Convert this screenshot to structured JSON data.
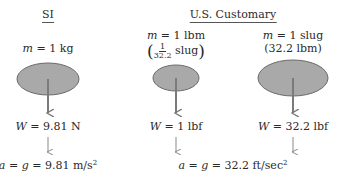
{
  "columns": [
    {
      "id": "si",
      "header": "SI",
      "mass_var": "m",
      "mass_text": "= 1 kg",
      "weight_var": "W",
      "weight_text": "= 9.81 N"
    },
    {
      "id": "us-lbm",
      "header": "",
      "mass_var": "m",
      "mass_text": "= 1 lbm",
      "mass_equiv_numerator": "1",
      "mass_equiv_denominator": "32.2",
      "mass_equiv_unit": "slug",
      "weight_var": "W",
      "weight_text": "= 1 lbf"
    },
    {
      "id": "us-slug",
      "header": "",
      "mass_var": "m",
      "mass_text": "= 1 slug",
      "mass_equiv_text": "(32.2 lbm)",
      "weight_var": "W",
      "weight_text": "= 32.2 lbf"
    }
  ],
  "group_header": "U.S. Customary",
  "si_acceleration": {
    "lhs": "a",
    "mid": "g",
    "value": "= 9.81 m/s",
    "exponent": "2"
  },
  "us_acceleration": {
    "lhs": "a",
    "mid": "g",
    "value": "= 32.2 ft/sec",
    "exponent": "2"
  },
  "colors": {
    "mass_fill": "#a9a9a9",
    "mass_stroke": "#6b6b6b",
    "arrow": "#7a7a7a",
    "text": "#2a2a2a"
  }
}
